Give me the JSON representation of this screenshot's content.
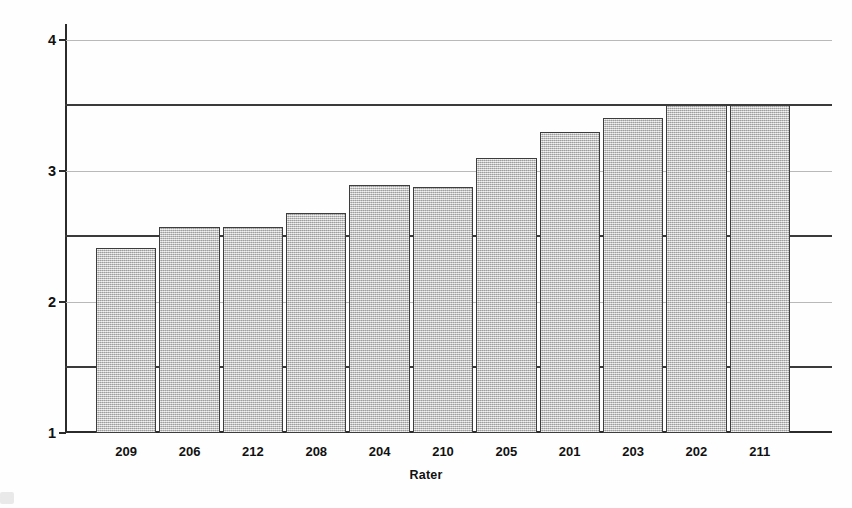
{
  "chart_data": {
    "type": "bar",
    "title": "",
    "xlabel": "Rater",
    "ylabel": "Mean score (1-6)",
    "categories": [
      "209",
      "206",
      "212",
      "208",
      "204",
      "210",
      "205",
      "201",
      "203",
      "202",
      "211"
    ],
    "values": [
      2.41,
      2.57,
      2.57,
      2.68,
      2.89,
      2.88,
      3.1,
      3.3,
      3.4,
      3.5,
      3.5
    ],
    "ylim": [
      1,
      4.12
    ],
    "y_ticks": [
      1,
      2,
      3,
      4
    ],
    "y_tick_labels": [
      "1",
      "2",
      "3",
      "4"
    ],
    "gridlines": [
      2,
      3,
      4
    ],
    "reference_lines": [
      1.5,
      2.5,
      3.5
    ],
    "grid": true,
    "legend": "none",
    "bar_fill_color": "#c9c9c9",
    "bar_edge_color": "#3d3d3d",
    "axis_color": "#2b2b2b",
    "gridline_color": "#b9b9b9",
    "reference_line_color": "#3a3a3a"
  },
  "axes": {
    "y_title": "Mean score (1-6)",
    "x_title": "Rater"
  }
}
